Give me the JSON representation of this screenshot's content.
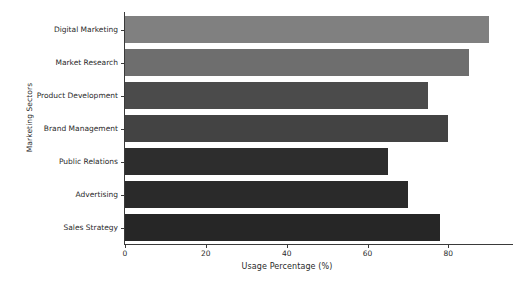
{
  "chart_data": {
    "type": "bar",
    "orientation": "horizontal",
    "title": "",
    "xlabel": "Usage Percentage (%)",
    "ylabel": "Marketing Sectors",
    "categories": [
      "Digital Marketing",
      "Market Research",
      "Product Development",
      "Brand Management",
      "Public Relations",
      "Advertising",
      "Sales Strategy"
    ],
    "values": [
      90,
      85,
      75,
      80,
      65,
      70,
      78
    ],
    "bar_colors": [
      "#808080",
      "#6e6e6e",
      "#4b4b4b",
      "#434343",
      "#2d2d2d",
      "#2a2a2a",
      "#262626"
    ],
    "xlim": [
      0,
      95
    ],
    "xticks": [
      0,
      20,
      40,
      60,
      80
    ],
    "xticklabels": [
      "0",
      "20",
      "40",
      "60",
      "80"
    ],
    "grid": false,
    "legend": null,
    "axis_color": "#3a3a3a",
    "background": "#ffffff"
  }
}
